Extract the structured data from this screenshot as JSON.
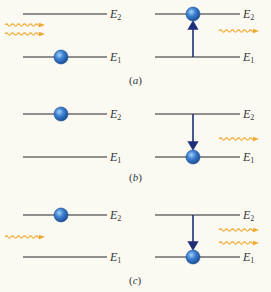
{
  "colors": {
    "background": "#fbfaf2",
    "level_line": "#6b6b6b",
    "electron_fill": "#2f6fc0",
    "electron_highlight": "#8fc0f0",
    "electron_stroke": "#1d4d8e",
    "transition_arrow": "#1f2e7a",
    "photon": "#f0a830",
    "text": "#333333"
  },
  "level_labels": {
    "upper": "E",
    "upper_sub": "2",
    "lower": "E",
    "lower_sub": "1"
  },
  "panels": [
    {
      "id": "a",
      "caption_open": "(",
      "caption_letter": "a",
      "caption_close": ")",
      "process": "absorption",
      "left": {
        "electron_level": "E1",
        "incoming_photons": 2
      },
      "right": {
        "electron_level": "E2",
        "transition": "up",
        "outgoing_photons": 1
      }
    },
    {
      "id": "b",
      "caption_open": "(",
      "caption_letter": "b",
      "caption_close": ")",
      "process": "spontaneous emission",
      "left": {
        "electron_level": "E2",
        "incoming_photons": 0
      },
      "right": {
        "electron_level": "E1",
        "transition": "down",
        "outgoing_photons": 1
      }
    },
    {
      "id": "c",
      "caption_open": "(",
      "caption_letter": "c",
      "caption_close": ")",
      "process": "stimulated emission",
      "left": {
        "electron_level": "E2",
        "incoming_photons": 1
      },
      "right": {
        "electron_level": "E1",
        "transition": "down",
        "outgoing_photons": 2
      }
    }
  ]
}
